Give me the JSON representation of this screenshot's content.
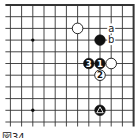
{
  "diagram": {
    "type": "go-board-fragment",
    "region": "top-right",
    "grid": {
      "columns": 12,
      "rows": 11,
      "x0": 10.4,
      "y0": 5,
      "dx": 11.2,
      "dy": 11.7,
      "top_edge": true,
      "right_edge": true,
      "line_color": "#333333"
    },
    "star_points": [
      {
        "col": 2,
        "row": 3
      },
      {
        "col": 2,
        "row": 9
      }
    ],
    "stones": [
      {
        "color": "white",
        "col": 6,
        "row": 2,
        "label": ""
      },
      {
        "color": "black",
        "col": 8,
        "row": 3,
        "label": ""
      },
      {
        "color": "black",
        "col": 7,
        "row": 5,
        "label": "3"
      },
      {
        "color": "black",
        "col": 8,
        "row": 5,
        "label": "1"
      },
      {
        "color": "white",
        "col": 9,
        "row": 5,
        "label": ""
      },
      {
        "color": "white",
        "col": 8,
        "row": 6,
        "label": "2"
      },
      {
        "color": "black",
        "col": 8,
        "row": 9,
        "label": "△"
      }
    ],
    "markers": [
      {
        "col": 9,
        "row": 2,
        "label": "a"
      },
      {
        "col": 9,
        "row": 3,
        "label": "b"
      }
    ],
    "caption": "図34"
  }
}
